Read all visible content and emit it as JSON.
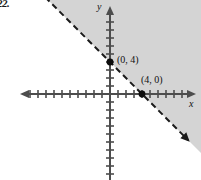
{
  "figure": {
    "problem_number": "22.",
    "width": 201,
    "height": 180,
    "background_color": "#ffffff"
  },
  "axes": {
    "x_label": "x",
    "y_label": "y",
    "axis_color": "#4d4d4d",
    "origin_px": [
      110,
      94
    ],
    "unit_px": 8,
    "x_axis_from_px": [
      22,
      94
    ],
    "x_axis_to_px": [
      194,
      94
    ],
    "y_axis_from_px": [
      110,
      8
    ],
    "y_axis_to_px": [
      110,
      178
    ],
    "x_tick_count_left": 11,
    "x_tick_count_right": 10,
    "y_tick_count_up": 10,
    "y_tick_count_down": 10,
    "tick_half_length_px": 4,
    "has_arrowheads": true
  },
  "points": [
    {
      "name": "y-intercept",
      "label": "(0, 4)",
      "x": 0,
      "y": 4,
      "px": [
        110,
        62
      ],
      "marker": "filled-dot"
    },
    {
      "name": "x-intercept",
      "label": "(4, 0)",
      "x": 4,
      "y": 0,
      "px": [
        142,
        94
      ],
      "marker": "filled-dot"
    }
  ],
  "boundary_line": {
    "style": "dashed",
    "color": "#1a1a1a",
    "equation": "x + y = 4",
    "slope": -1,
    "y_intercept": 4,
    "x_intercept": 4,
    "dash_pattern": "6 4",
    "stroke_width": 2,
    "has_arrowheads_both_ends": true,
    "from_px": [
      64,
      140
    ],
    "to_px": [
      188,
      16
    ]
  },
  "shaded_region": {
    "name": "solution-region",
    "fill_color": "#d4d4d4",
    "inequality": "x + y > 4",
    "side": "above-right-of-line",
    "boundary_included": false
  },
  "chart_data": {
    "type": "line",
    "title": "",
    "xlabel": "x",
    "ylabel": "y",
    "xlim": [
      -11,
      10
    ],
    "ylim": [
      -10,
      10
    ],
    "grid": false,
    "legend": "none",
    "series": [
      {
        "name": "boundary-line",
        "style": "dashed",
        "equation": "x + y = 4",
        "x": [
          -4,
          12
        ],
        "y": [
          8,
          -8
        ]
      }
    ],
    "annotations": [
      {
        "text": "(0, 4)",
        "x": 0,
        "y": 4
      },
      {
        "text": "(4, 0)",
        "x": 4,
        "y": 0
      }
    ],
    "shaded_regions": [
      {
        "inequality": "x + y > 4",
        "fill": "#d4d4d4",
        "boundary": "dashed-excluded"
      }
    ]
  }
}
